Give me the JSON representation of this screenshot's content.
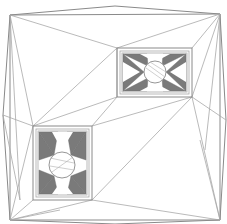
{
  "diagram": {
    "type": "triangulated-mesh",
    "colors": {
      "background": "#ffffff",
      "edge": "#a8a8a8",
      "dense_fill": "#7a7a7a"
    },
    "outer_boundary": {
      "corners": [
        [
          10,
          15
        ],
        [
          220,
          14
        ],
        [
          220,
          220
        ],
        [
          10,
          220
        ]
      ],
      "bulges": {
        "top": [
          115,
          6
        ],
        "right": [
          226,
          120
        ],
        "bottom": [
          115,
          224
        ],
        "left": [
          3,
          115
        ]
      }
    },
    "holes": [
      {
        "name": "upper-right-rectangle",
        "outer": [
          117,
          48,
          192,
          97
        ],
        "inner": [
          122,
          53,
          187,
          92
        ],
        "circle": {
          "cx": 155,
          "cy": 72,
          "r": 11
        }
      },
      {
        "name": "lower-left-rectangle",
        "outer": [
          33,
          126,
          92,
          200
        ],
        "inner": [
          38,
          131,
          87,
          195
        ],
        "circle": {
          "cx": 62,
          "cy": 165,
          "r": 13
        }
      }
    ]
  }
}
